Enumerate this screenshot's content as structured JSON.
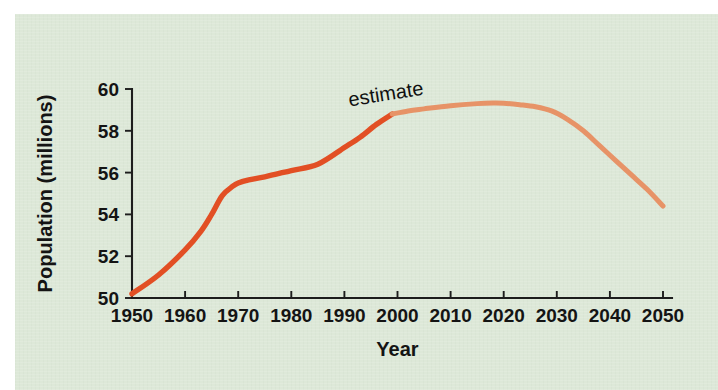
{
  "figure": {
    "background_color": "#dde8d8",
    "page_color": "#ffffff",
    "axis_color": "#1d1d1d"
  },
  "chart_data": {
    "type": "line",
    "title": "",
    "xlabel": "Year",
    "ylabel": "Population (millions)",
    "xlim": [
      1950,
      2050
    ],
    "ylim": [
      50,
      60
    ],
    "xticks": [
      1950,
      1960,
      1970,
      1980,
      1990,
      2000,
      2010,
      2020,
      2030,
      2040,
      2050
    ],
    "yticks": [
      50,
      52,
      54,
      56,
      58,
      60
    ],
    "xtick_labels": [
      "1950",
      "1960",
      "1970",
      "1980",
      "1990",
      "2000",
      "2010",
      "2020",
      "2030",
      "2040",
      "2050"
    ],
    "ytick_labels": [
      "50",
      "52",
      "54",
      "56",
      "58",
      "60"
    ],
    "grid": false,
    "legend": false,
    "annotations": [
      {
        "name": "estimate-label",
        "text": "estimate",
        "x": 1998,
        "y": 59.45,
        "rotation": -9
      }
    ],
    "series": [
      {
        "name": "actual",
        "color": "#e24f24",
        "linewidth": 5.4,
        "x": [
          1950,
          1955,
          1960,
          1963,
          1965,
          1967,
          1969,
          1970,
          1972,
          1975,
          1980,
          1985,
          1990,
          1993,
          1996,
          1999
        ],
        "values": [
          50.2,
          51.1,
          52.3,
          53.2,
          54.0,
          54.9,
          55.35,
          55.5,
          55.65,
          55.8,
          56.1,
          56.4,
          57.2,
          57.7,
          58.3,
          58.8
        ]
      },
      {
        "name": "estimate",
        "color": "#e79367",
        "linewidth": 5.0,
        "x": [
          1999,
          2002,
          2005,
          2010,
          2015,
          2018,
          2020,
          2023,
          2026,
          2029,
          2032,
          2035,
          2038,
          2041,
          2044,
          2047,
          2050
        ],
        "values": [
          58.8,
          58.95,
          59.05,
          59.2,
          59.3,
          59.33,
          59.32,
          59.25,
          59.15,
          58.95,
          58.55,
          58.0,
          57.3,
          56.6,
          55.9,
          55.2,
          54.4
        ]
      }
    ]
  }
}
